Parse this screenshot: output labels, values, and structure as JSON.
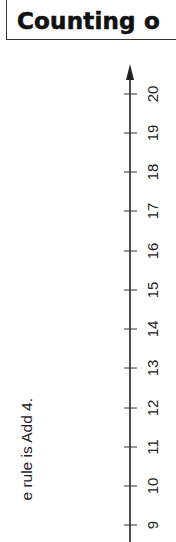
{
  "title": {
    "text": "Counting o"
  },
  "instruction": {
    "text": "e rule is Add 4."
  },
  "number_line": {
    "orientation": "vertical",
    "direction": "up",
    "axis_color": "#222222",
    "arrow": "up",
    "ticks": [
      {
        "label": "20",
        "y": 94
      },
      {
        "label": "19",
        "y": 133
      },
      {
        "label": "18",
        "y": 172
      },
      {
        "label": "17",
        "y": 211
      },
      {
        "label": "16",
        "y": 251
      },
      {
        "label": "15",
        "y": 290
      },
      {
        "label": "14",
        "y": 329
      },
      {
        "label": "13",
        "y": 368
      },
      {
        "label": "12",
        "y": 408
      },
      {
        "label": "11",
        "y": 447
      },
      {
        "label": "10",
        "y": 486
      },
      {
        "label": "9",
        "y": 525
      }
    ]
  }
}
